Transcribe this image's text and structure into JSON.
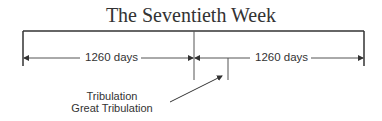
{
  "diagram": {
    "title": "The Seventieth Week",
    "periods": [
      {
        "label": "1260 days"
      },
      {
        "label": "1260 days"
      }
    ],
    "annotation": {
      "line1": "Tribulation",
      "line2": "Great Tribulation"
    },
    "colors": {
      "line": "#333333",
      "text": "#333333",
      "background": "#ffffff"
    }
  }
}
